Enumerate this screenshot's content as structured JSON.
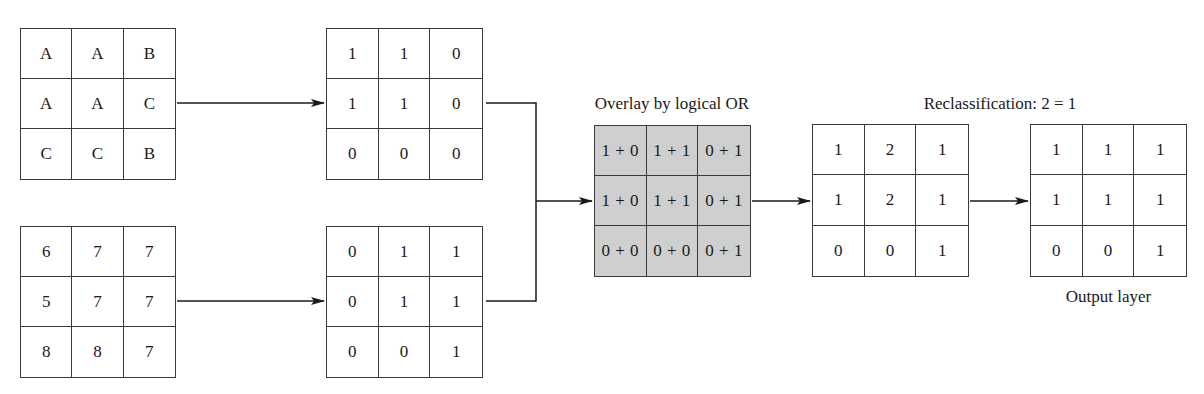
{
  "labels": {
    "overlay_title": "Overlay by logical OR",
    "reclass_title": "Reclassification: 2 = 1",
    "output_title": "Output layer"
  },
  "grids": {
    "input_letters": [
      [
        "A",
        "A",
        "B"
      ],
      [
        "A",
        "A",
        "C"
      ],
      [
        "C",
        "C",
        "B"
      ]
    ],
    "input_numbers": [
      [
        "6",
        "7",
        "7"
      ],
      [
        "5",
        "7",
        "7"
      ],
      [
        "8",
        "8",
        "7"
      ]
    ],
    "binary_top": [
      [
        "1",
        "1",
        "0"
      ],
      [
        "1",
        "1",
        "0"
      ],
      [
        "0",
        "0",
        "0"
      ]
    ],
    "binary_bottom": [
      [
        "0",
        "1",
        "1"
      ],
      [
        "0",
        "1",
        "1"
      ],
      [
        "0",
        "0",
        "1"
      ]
    ],
    "overlay": [
      [
        "1 + 0",
        "1 + 1",
        "0 + 1"
      ],
      [
        "1 + 0",
        "1 + 1",
        "0 + 1"
      ],
      [
        "0 + 0",
        "0 + 0",
        "0 + 1"
      ]
    ],
    "reclass": [
      [
        "1",
        "2",
        "1"
      ],
      [
        "1",
        "2",
        "1"
      ],
      [
        "0",
        "0",
        "1"
      ]
    ],
    "output": [
      [
        "1",
        "1",
        "1"
      ],
      [
        "1",
        "1",
        "1"
      ],
      [
        "0",
        "0",
        "1"
      ]
    ]
  },
  "colors": {
    "line": "#1a1a1a",
    "overlay_fill": "#cfcfcf"
  }
}
